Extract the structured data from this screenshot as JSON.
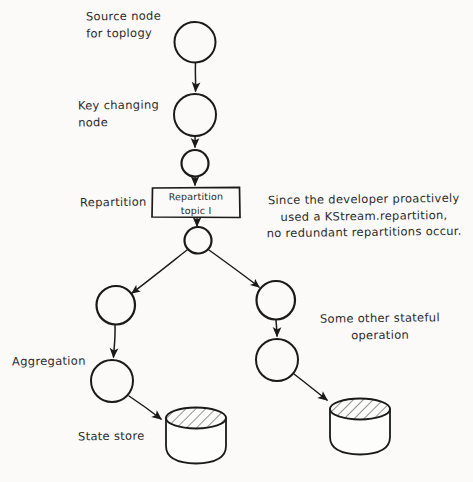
{
  "diagram": {
    "type": "hand-drawn-flow-diagram",
    "background_color": "#fbfaf8",
    "ink_color": "#1a1a1a",
    "labels": {
      "source_node": "Source node\nfor toplogy",
      "key_changing_node": "Key changing\nnode",
      "repartition": "Repartition",
      "repartition_topic_box": "Repartition\ntopic I",
      "annotation": "Since the developer proactively\nused a KStream.repartition,\nno redundant repartitions occur.",
      "some_other_stateful_operation": "Some other stateful\noperation",
      "aggregation": "Aggregation",
      "state_store": "State store"
    },
    "nodes": [
      {
        "id": "source-node",
        "shape": "circle",
        "fill": "diagonal-hatch",
        "cx": 195,
        "cy": 42,
        "r": 20
      },
      {
        "id": "key-changing-node",
        "shape": "circle",
        "fill": "diagonal-hatch",
        "cx": 195,
        "cy": 115,
        "r": 21
      },
      {
        "id": "repartition-source-node",
        "shape": "circle",
        "fill": "cross-hatch",
        "cx": 195,
        "cy": 163,
        "r": 13
      },
      {
        "id": "repartition-topic",
        "shape": "rect",
        "fill": "none",
        "x": 152,
        "y": 187,
        "w": 88,
        "h": 31
      },
      {
        "id": "repartition-sink-node",
        "shape": "circle",
        "fill": "cross-hatch",
        "cx": 198,
        "cy": 240,
        "r": 13
      },
      {
        "id": "left-stateful-node",
        "shape": "circle",
        "fill": "cross-hatch",
        "cx": 116,
        "cy": 305,
        "r": 19
      },
      {
        "id": "right-stateful-node",
        "shape": "circle",
        "fill": "cross-hatch",
        "cx": 276,
        "cy": 300,
        "r": 19
      },
      {
        "id": "aggregation-node",
        "shape": "circle",
        "fill": "diagonal-hatch",
        "cx": 112,
        "cy": 381,
        "r": 21
      },
      {
        "id": "right-operation-node",
        "shape": "circle",
        "fill": "diagonal-hatch",
        "cx": 277,
        "cy": 360,
        "r": 21
      },
      {
        "id": "left-state-store",
        "shape": "cylinder",
        "fill": "diagonal-hatch-top",
        "x": 166,
        "y": 409,
        "w": 60,
        "h": 54
      },
      {
        "id": "right-state-store",
        "shape": "cylinder",
        "fill": "diagonal-hatch-top",
        "x": 330,
        "y": 400,
        "w": 60,
        "h": 54
      }
    ],
    "edges": [
      {
        "id": "edge-source-to-key",
        "from": "source-node",
        "to": "key-changing-node"
      },
      {
        "id": "edge-key-to-repartition-source",
        "from": "key-changing-node",
        "to": "repartition-source-node"
      },
      {
        "id": "edge-repartition-source-to-topic",
        "from": "repartition-source-node",
        "to": "repartition-topic"
      },
      {
        "id": "edge-topic-to-repartition-sink",
        "from": "repartition-topic",
        "to": "repartition-sink-node"
      },
      {
        "id": "edge-fork-left",
        "from": "repartition-sink-node",
        "to": "left-stateful-node"
      },
      {
        "id": "edge-fork-right",
        "from": "repartition-sink-node",
        "to": "right-stateful-node"
      },
      {
        "id": "edge-left-stateful-to-aggregation",
        "from": "left-stateful-node",
        "to": "aggregation-node"
      },
      {
        "id": "edge-right-stateful-to-operation",
        "from": "right-stateful-node",
        "to": "right-operation-node"
      },
      {
        "id": "edge-aggregation-to-store",
        "from": "aggregation-node",
        "to": "left-state-store"
      },
      {
        "id": "edge-operation-to-store",
        "from": "right-operation-node",
        "to": "right-state-store"
      }
    ]
  }
}
